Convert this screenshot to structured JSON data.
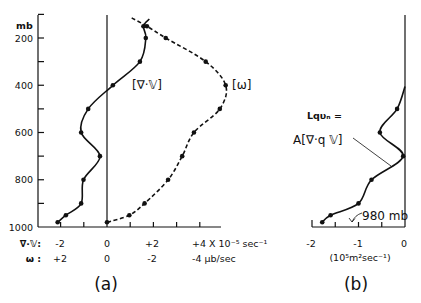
{
  "figure": {
    "panel_a": {
      "label": "(a)",
      "y_unit": "mb",
      "y_ticks": [
        "200",
        "400",
        "600",
        "800",
        "1000"
      ],
      "series_labels": {
        "div": "[∇·𝕍]",
        "omega": "[ω]"
      },
      "x_rows": [
        {
          "label": "∇·𝕍:",
          "values": [
            "-2",
            "0",
            "+2",
            "+4 X 10⁻⁵ sec⁻¹"
          ]
        },
        {
          "label": "ω :",
          "values": [
            "+2",
            "0",
            "-2",
            "-4 μb/sec"
          ]
        }
      ]
    },
    "panel_b": {
      "label": "(b)",
      "equation_line1": "Lqυₙ =",
      "equation_line2": "A[∇·q 𝕍]",
      "annotation": "980 mb",
      "x_ticks": [
        "-2",
        "-1",
        "0"
      ],
      "x_unit": "(10⁵m²sec⁻¹)"
    }
  },
  "chart_data": [
    {
      "type": "line",
      "panel": "(a)",
      "title": "",
      "ylabel": "mb",
      "y_reversed": true,
      "ylim": [
        100,
        1000
      ],
      "yticks": [
        200,
        400,
        600,
        800,
        1000
      ],
      "xlabel": "∇·𝕍 (10⁻⁵ sec⁻¹) ; ω (μb/sec)",
      "xlim": [
        -2.9,
        4.9
      ],
      "xticks": [
        -2,
        0,
        2,
        4
      ],
      "secondary_xticks": [
        2,
        0,
        -2,
        -4
      ],
      "grid": false,
      "series": [
        {
          "name": "[∇·𝕍]",
          "units": "10⁻⁵ sec⁻¹",
          "style": "solid",
          "axis": "div",
          "points": [
            {
              "p": 120,
              "v": 1.8,
              "marker": false
            },
            {
              "p": 150,
              "v": 1.55,
              "marker": true
            },
            {
              "p": 200,
              "v": 1.65,
              "marker": true
            },
            {
              "p": 300,
              "v": 1.4,
              "marker": true
            },
            {
              "p": 400,
              "v": 0.25,
              "marker": true
            },
            {
              "p": 500,
              "v": -0.8,
              "marker": true
            },
            {
              "p": 600,
              "v": -1.1,
              "marker": true
            },
            {
              "p": 700,
              "v": -0.3,
              "marker": true
            },
            {
              "p": 800,
              "v": -1.0,
              "marker": true
            },
            {
              "p": 900,
              "v": -1.1,
              "marker": true
            },
            {
              "p": 950,
              "v": -1.75,
              "marker": true
            },
            {
              "p": 980,
              "v": -2.1,
              "marker": true
            }
          ]
        },
        {
          "name": "[ω]",
          "units": "μb/sec",
          "style": "dashed",
          "axis": "omega",
          "points": [
            {
              "p": 115,
              "v": -1.05,
              "marker": false
            },
            {
              "p": 150,
              "v": -1.7,
              "marker": true
            },
            {
              "p": 200,
              "v": -2.5,
              "marker": true
            },
            {
              "p": 300,
              "v": -4.2,
              "marker": true
            },
            {
              "p": 400,
              "v": -5.05,
              "marker": true
            },
            {
              "p": 500,
              "v": -4.8,
              "marker": true
            },
            {
              "p": 600,
              "v": -3.7,
              "marker": true
            },
            {
              "p": 700,
              "v": -3.2,
              "marker": true
            },
            {
              "p": 800,
              "v": -2.6,
              "marker": true
            },
            {
              "p": 900,
              "v": -1.6,
              "marker": true
            },
            {
              "p": 950,
              "v": -0.95,
              "marker": true
            },
            {
              "p": 980,
              "v": 0.0,
              "marker": true
            }
          ]
        }
      ]
    },
    {
      "type": "line",
      "panel": "(b)",
      "title": "",
      "ylabel": "mb",
      "y_reversed": true,
      "ylim": [
        100,
        1000
      ],
      "xlabel": "10⁵ m² sec⁻¹",
      "xlim": [
        -2,
        0
      ],
      "xticks": [
        -2,
        -1,
        0
      ],
      "grid": false,
      "annotations": [
        "Lqυₙ = A[∇·q 𝕍]",
        "980 mb"
      ],
      "series": [
        {
          "name": "Lqυₙ = A[∇·q 𝕍]",
          "style": "solid",
          "axis": "b",
          "points": [
            {
              "p": 405,
              "v": 0.0,
              "marker": false
            },
            {
              "p": 500,
              "v": -0.17,
              "marker": true
            },
            {
              "p": 600,
              "v": -0.54,
              "marker": true
            },
            {
              "p": 700,
              "v": -0.04,
              "marker": true
            },
            {
              "p": 800,
              "v": -0.72,
              "marker": true
            },
            {
              "p": 900,
              "v": -1.0,
              "marker": true
            },
            {
              "p": 950,
              "v": -1.6,
              "marker": true
            },
            {
              "p": 980,
              "v": -1.78,
              "marker": true
            }
          ]
        }
      ]
    }
  ]
}
